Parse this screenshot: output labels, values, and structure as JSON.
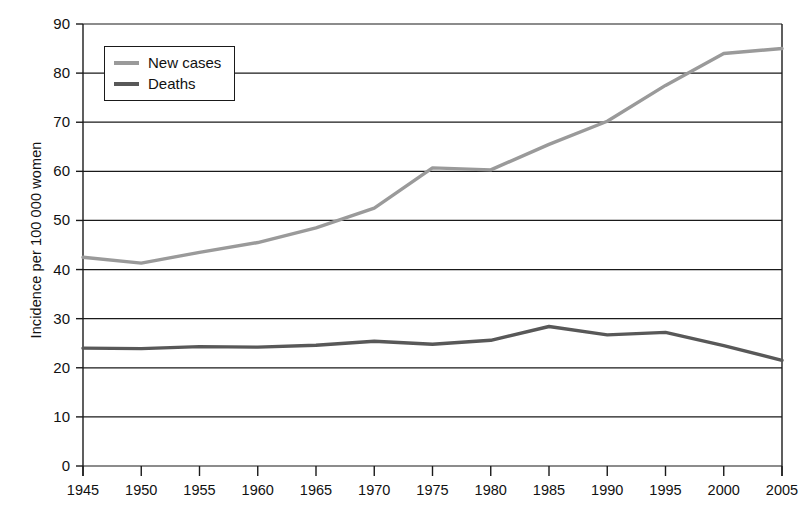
{
  "chart_data": {
    "type": "line",
    "title": "",
    "xlabel": "",
    "ylabel": "Incidence per 100 000 women",
    "x": [
      1945,
      1950,
      1955,
      1960,
      1965,
      1970,
      1975,
      1980,
      1985,
      1990,
      1995,
      2000,
      2005
    ],
    "categories": [
      "1945",
      "1950",
      "1955",
      "1960",
      "1965",
      "1970",
      "1975",
      "1980",
      "1985",
      "1990",
      "1995",
      "2000",
      "2005"
    ],
    "series": [
      {
        "name": "New cases",
        "color": "#9a9a9a",
        "values": [
          42.5,
          41.3,
          43.5,
          45.5,
          48.5,
          52.5,
          60.7,
          60.3,
          65.5,
          70.2,
          77.5,
          84.0,
          85.0
        ]
      },
      {
        "name": "Deaths",
        "color": "#585858",
        "values": [
          24.0,
          23.9,
          24.3,
          24.2,
          24.6,
          25.4,
          24.8,
          25.6,
          28.4,
          26.7,
          27.2,
          24.5,
          21.5
        ]
      }
    ],
    "ylim": [
      0,
      90
    ],
    "ytick_values": [
      0,
      10,
      20,
      30,
      40,
      50,
      60,
      70,
      80,
      90
    ],
    "ytick_labels": [
      "0",
      "10",
      "20",
      "30",
      "40",
      "50",
      "60",
      "70",
      "80",
      "90"
    ],
    "xlim": [
      1945,
      2005
    ],
    "grid": "horizontal",
    "legend_position": "top-left-inside",
    "axis_color": "#1a1a1a",
    "background_color": "#ffffff"
  }
}
